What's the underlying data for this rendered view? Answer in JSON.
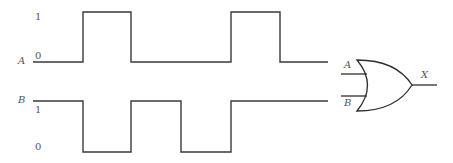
{
  "diagram": {
    "type": "timing-diagram-with-or-gate",
    "signals": [
      {
        "name": "A",
        "level_labels": {
          "high": "1",
          "low": "0"
        },
        "sequence": [
          0,
          1,
          0,
          0,
          1,
          0
        ]
      },
      {
        "name": "B",
        "level_labels": {
          "high": "1",
          "low": "0"
        },
        "sequence": [
          1,
          0,
          1,
          0,
          1,
          1
        ]
      }
    ],
    "gate": {
      "type": "OR",
      "inputs": [
        "A",
        "B"
      ],
      "output": "X"
    }
  },
  "labels": {
    "a_signal": "A",
    "a_high": "1",
    "a_low": "0",
    "b_signal": "B",
    "b_high": "1",
    "b_low": "0",
    "gate_in_a": "A",
    "gate_in_b": "B",
    "gate_out": "X"
  },
  "colors": {
    "line": "#3a3a3a",
    "text": "#555555"
  }
}
